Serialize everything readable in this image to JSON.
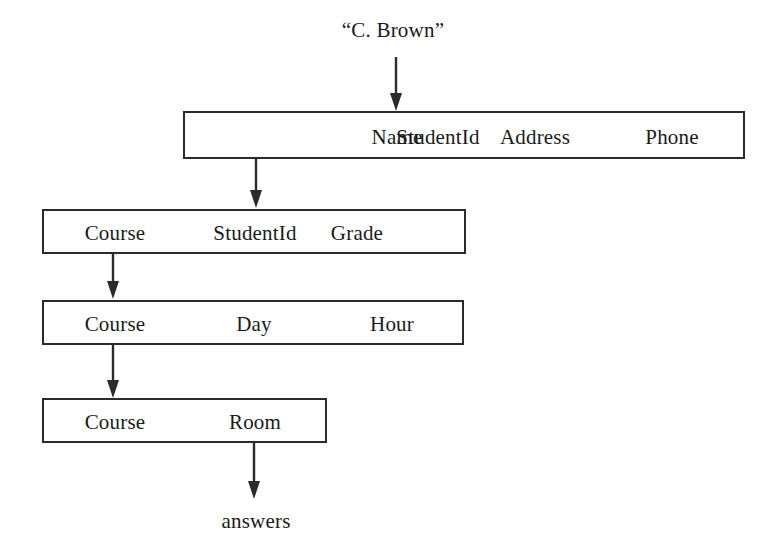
{
  "diagram": {
    "title_label": "“C. Brown”",
    "result_label": "answers",
    "relations": [
      {
        "name": "student-relation",
        "attributes": [
          "StudentId",
          "Name",
          "Address",
          "Phone"
        ]
      },
      {
        "name": "enrollment-relation",
        "attributes": [
          "Course",
          "StudentId",
          "Grade"
        ]
      },
      {
        "name": "schedule-relation",
        "attributes": [
          "Course",
          "Day",
          "Hour"
        ]
      },
      {
        "name": "room-relation",
        "attributes": [
          "Course",
          "Room"
        ]
      }
    ],
    "arrows": [
      {
        "name": "input-arrow-to-student",
        "from": "“C. Brown”",
        "to": "Name"
      },
      {
        "name": "arrow-student-to-enrollment",
        "from": "StudentId",
        "to": "StudentId"
      },
      {
        "name": "arrow-enrollment-to-schedule",
        "from": "Course",
        "to": "Course"
      },
      {
        "name": "arrow-schedule-to-room",
        "from": "Course",
        "to": "Course"
      },
      {
        "name": "output-arrow-to-answers",
        "from": "Room",
        "to": "answers"
      }
    ],
    "colors": {
      "stroke": "#2b2b2b",
      "text": "#1a1a1a",
      "background": "#ffffff"
    }
  }
}
